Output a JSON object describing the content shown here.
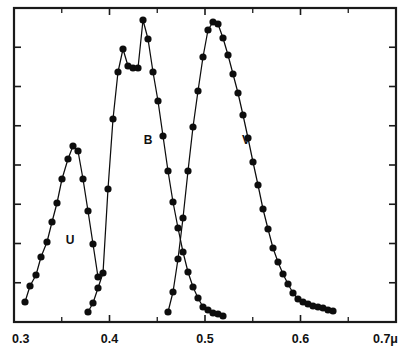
{
  "chart_data": {
    "type": "line",
    "title": "",
    "subtitle": "",
    "xlabel": "",
    "ylabel": "",
    "xlim": [
      0.29,
      0.715
    ],
    "ylim": [
      0,
      1.0
    ],
    "grid": false,
    "legend_position": "inline-annotations",
    "x_tick_labels": [
      "0.3",
      "0.4",
      "0.5",
      "0.6",
      "0.7μ"
    ],
    "x_tick_values": [
      0.3,
      0.4,
      0.5,
      0.6,
      0.7
    ],
    "x_minor_tick_values": [
      0.35,
      0.45,
      0.55,
      0.65
    ],
    "y_tick_count": 7,
    "y_tick_labels": [],
    "annotations": [
      {
        "text": "U",
        "x": 0.355,
        "y": 0.27
      },
      {
        "text": "B",
        "x": 0.44,
        "y": 0.585
      },
      {
        "text": "V",
        "x": 0.547,
        "y": 0.585
      }
    ],
    "series": [
      {
        "name": "U",
        "label": "U",
        "marker": "filled-circle",
        "x": [
          0.3,
          0.307,
          0.315,
          0.322,
          0.33,
          0.337,
          0.345,
          0.352,
          0.36,
          0.367,
          0.374,
          0.381,
          0.388,
          0.395,
          0.402
        ],
        "y": [
          0.065,
          0.115,
          0.15,
          0.208,
          0.256,
          0.318,
          0.38,
          0.455,
          0.52,
          0.56,
          0.545,
          0.455,
          0.355,
          0.25,
          0.148
        ],
        "points_px": [
          [
            25,
            302
          ],
          [
            30,
            286
          ],
          [
            36,
            275
          ],
          [
            41,
            257
          ],
          [
            47,
            242
          ],
          [
            52,
            222
          ],
          [
            57,
            203
          ],
          [
            62,
            179
          ],
          [
            68,
            159
          ],
          [
            73,
            146
          ],
          [
            78,
            151
          ],
          [
            83,
            179
          ],
          [
            88,
            211
          ],
          [
            93,
            244
          ],
          [
            98,
            277
          ]
        ]
      },
      {
        "name": "B",
        "label": "B",
        "marker": "filled-circle",
        "x": [
          0.37,
          0.377,
          0.384,
          0.391,
          0.398,
          0.405,
          0.412,
          0.419,
          0.426,
          0.433,
          0.44,
          0.447,
          0.454,
          0.461,
          0.468,
          0.475,
          0.482,
          0.489,
          0.496,
          0.503,
          0.51,
          0.517,
          0.524,
          0.531,
          0.538,
          0.545,
          0.552,
          0.559
        ],
        "y": [
          0.03,
          0.06,
          0.105,
          0.155,
          0.42,
          0.64,
          0.79,
          0.86,
          0.805,
          0.8,
          0.8,
          0.955,
          0.895,
          0.79,
          0.7,
          0.59,
          0.48,
          0.38,
          0.3,
          0.225,
          0.16,
          0.115,
          0.078,
          0.05,
          0.04,
          0.032,
          0.028,
          0.022
        ],
        "points_px": [
          [
            88,
            312
          ],
          [
            93,
            303
          ],
          [
            98,
            288
          ],
          [
            103,
            273
          ],
          [
            108,
            189
          ],
          [
            113,
            119
          ],
          [
            118,
            72
          ],
          [
            123,
            49
          ],
          [
            128,
            66
          ],
          [
            133,
            68
          ],
          [
            138,
            68
          ],
          [
            143,
            20
          ],
          [
            148,
            39
          ],
          [
            153,
            72
          ],
          [
            158,
            101
          ],
          [
            163,
            136
          ],
          [
            168,
            171
          ],
          [
            173,
            202
          ],
          [
            178,
            228
          ],
          [
            183,
            252
          ],
          [
            188,
            272
          ],
          [
            193,
            287
          ],
          [
            198,
            298
          ],
          [
            203,
            307
          ],
          [
            208,
            310
          ],
          [
            213,
            313
          ],
          [
            218,
            314
          ],
          [
            223,
            316
          ]
        ]
      },
      {
        "name": "V",
        "label": "V",
        "marker": "filled-circle",
        "x": [
          0.472,
          0.479,
          0.486,
          0.493,
          0.5,
          0.507,
          0.514,
          0.521,
          0.528,
          0.535,
          0.542,
          0.549,
          0.556,
          0.563,
          0.57,
          0.577,
          0.584,
          0.591,
          0.598,
          0.605,
          0.612,
          0.619,
          0.626,
          0.633,
          0.64,
          0.647,
          0.654,
          0.661,
          0.668,
          0.675,
          0.682,
          0.689,
          0.696,
          0.7
        ],
        "y": [
          0.03,
          0.095,
          0.2,
          0.33,
          0.48,
          0.62,
          0.735,
          0.845,
          0.93,
          0.955,
          0.95,
          0.905,
          0.85,
          0.79,
          0.73,
          0.66,
          0.585,
          0.51,
          0.435,
          0.36,
          0.295,
          0.235,
          0.19,
          0.15,
          0.118,
          0.09,
          0.072,
          0.06,
          0.055,
          0.05,
          0.046,
          0.042,
          0.038,
          0.035
        ],
        "points_px": [
          [
            168,
            312
          ],
          [
            173,
            292
          ],
          [
            178,
            259
          ],
          [
            183,
            218
          ],
          [
            188,
            171
          ],
          [
            193,
            127
          ],
          [
            198,
            91
          ],
          [
            203,
            57
          ],
          [
            208,
            30
          ],
          [
            213,
            22
          ],
          [
            218,
            24
          ],
          [
            223,
            38
          ],
          [
            228,
            55
          ],
          [
            233,
            74
          ],
          [
            238,
            93
          ],
          [
            243,
            115
          ],
          [
            248,
            138
          ],
          [
            253,
            162
          ],
          [
            258,
            185
          ],
          [
            263,
            209
          ],
          [
            268,
            229
          ],
          [
            273,
            248
          ],
          [
            278,
            262
          ],
          [
            283,
            274
          ],
          [
            288,
            284
          ],
          [
            293,
            293
          ],
          [
            298,
            299
          ],
          [
            303,
            302
          ],
          [
            308,
            304
          ],
          [
            313,
            306
          ],
          [
            318,
            307
          ],
          [
            323,
            308
          ],
          [
            328,
            310
          ],
          [
            333,
            311
          ]
        ]
      }
    ]
  },
  "axis": {
    "x_labels": [
      "0.3",
      "0.4",
      "0.5",
      "0.6",
      "0.7μ"
    ]
  },
  "labels": {
    "u": "U",
    "b": "B",
    "v": "V"
  },
  "colors": {
    "ink": "#0d0d0d",
    "frame": "#1a1a1a",
    "background": "#ffffff"
  }
}
